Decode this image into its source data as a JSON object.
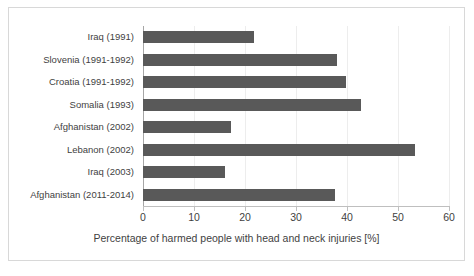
{
  "chart_data": {
    "type": "bar",
    "orientation": "horizontal",
    "title": "",
    "xlabel": "Percentage of harmed people with head and neck injuries [%]",
    "ylabel": "",
    "xlim": [
      0,
      60
    ],
    "xticks": [
      0,
      10,
      20,
      30,
      40,
      50,
      60
    ],
    "xtick_labels": [
      "0",
      "10",
      "20",
      "30",
      "40",
      "50",
      "60"
    ],
    "grid": "vertical",
    "legend": "none",
    "bar_color": "#595959",
    "categories": [
      "Iraq (1991)",
      "Slovenia (1991-1992)",
      "Croatia (1991-1992)",
      "Somalia (1993)",
      "Afghanistan (2002)",
      "Lebanon (2002)",
      "Iraq (2003)",
      "Afghanistan (2011-2014)"
    ],
    "values": [
      21.8,
      38.0,
      39.8,
      42.7,
      17.3,
      53.3,
      16.0,
      37.6
    ]
  },
  "figure": {
    "background_color": "#ffffff",
    "border_color": "#d8d8d8",
    "axis_color": "#bfbfbf",
    "gridline_color": "#ededed",
    "text_color": "#3f3f3f"
  }
}
